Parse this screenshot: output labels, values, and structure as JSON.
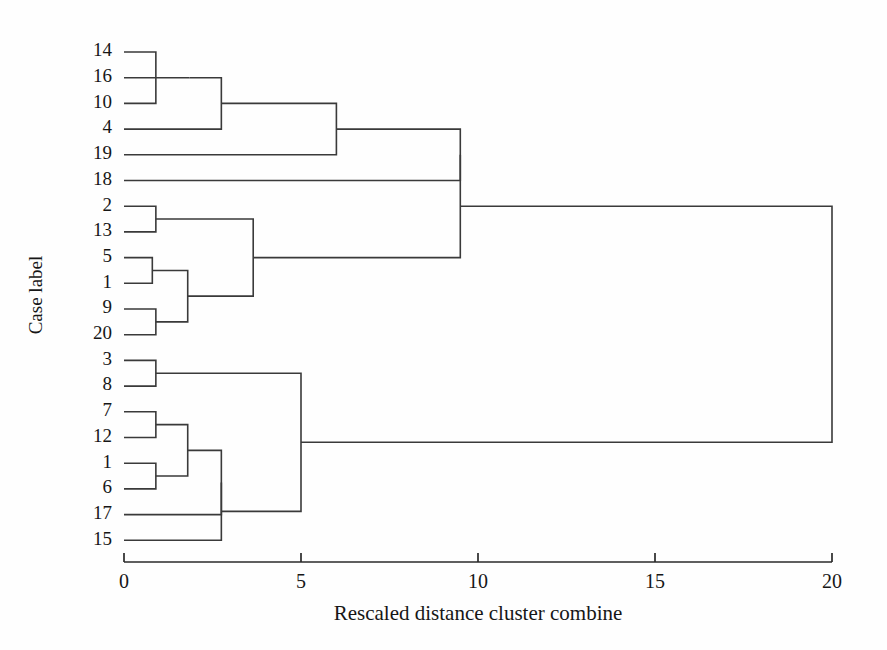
{
  "figure": {
    "title": "",
    "background": "#fefefe",
    "line_color": "#3a3a3a",
    "text_color": "#161616"
  },
  "chart_data": {
    "type": "dendrogram",
    "title": "",
    "xlabel": "Rescaled distance cluster combine",
    "ylabel": "Case label",
    "xlim": [
      0,
      20
    ],
    "xticks": [
      0,
      5,
      10,
      15,
      20
    ],
    "xticklabels": [
      "0",
      "5",
      "10",
      "15",
      "20"
    ],
    "grid": false,
    "orientation": "horizontal",
    "leaf_labels": [
      "14",
      "16",
      "10",
      "4",
      "19",
      "18",
      "2",
      "13",
      "5",
      "1",
      "9",
      "20",
      "3",
      "8",
      "7",
      "12",
      "1",
      "6",
      "17",
      "15"
    ],
    "leaf_order_index": [
      0,
      1,
      2,
      3,
      4,
      5,
      6,
      7,
      8,
      9,
      10,
      11,
      12,
      13,
      14,
      15,
      16,
      17,
      18,
      19
    ],
    "merges": [
      {
        "id": "m1",
        "left": {
          "type": "leaf",
          "index": 0
        },
        "right": {
          "type": "leaf",
          "index": 2
        },
        "distance": 0.9
      },
      {
        "id": "m2",
        "left": {
          "type": "node",
          "id": "m1"
        },
        "right": {
          "type": "leaf",
          "index": 1
        },
        "distance": 1.85
      },
      {
        "id": "m3",
        "left": {
          "type": "node",
          "id": "m2"
        },
        "right": {
          "type": "leaf",
          "index": 3
        },
        "distance": 2.75
      },
      {
        "id": "m4",
        "left": {
          "type": "node",
          "id": "m3"
        },
        "right": {
          "type": "leaf",
          "index": 4
        },
        "distance": 6.0
      },
      {
        "id": "m5",
        "left": {
          "type": "node",
          "id": "m4"
        },
        "right": {
          "type": "leaf",
          "index": 5
        },
        "distance": 9.5
      },
      {
        "id": "m6",
        "left": {
          "type": "leaf",
          "index": 6
        },
        "right": {
          "type": "leaf",
          "index": 7
        },
        "distance": 0.9
      },
      {
        "id": "m7",
        "left": {
          "type": "leaf",
          "index": 8
        },
        "right": {
          "type": "leaf",
          "index": 9
        },
        "distance": 0.8
      },
      {
        "id": "m8",
        "left": {
          "type": "leaf",
          "index": 10
        },
        "right": {
          "type": "leaf",
          "index": 11
        },
        "distance": 0.9
      },
      {
        "id": "m9",
        "left": {
          "type": "node",
          "id": "m7"
        },
        "right": {
          "type": "node",
          "id": "m8"
        },
        "distance": 1.8
      },
      {
        "id": "m10",
        "left": {
          "type": "node",
          "id": "m6"
        },
        "right": {
          "type": "node",
          "id": "m9"
        },
        "distance": 3.65
      },
      {
        "id": "m11",
        "left": {
          "type": "node",
          "id": "m5"
        },
        "right": {
          "type": "node",
          "id": "m10"
        },
        "distance": 9.5
      },
      {
        "id": "m12",
        "left": {
          "type": "leaf",
          "index": 12
        },
        "right": {
          "type": "leaf",
          "index": 13
        },
        "distance": 0.9
      },
      {
        "id": "m13",
        "left": {
          "type": "leaf",
          "index": 14
        },
        "right": {
          "type": "leaf",
          "index": 15
        },
        "distance": 0.9
      },
      {
        "id": "m14",
        "left": {
          "type": "leaf",
          "index": 16
        },
        "right": {
          "type": "leaf",
          "index": 17
        },
        "distance": 0.9
      },
      {
        "id": "m15",
        "left": {
          "type": "node",
          "id": "m13"
        },
        "right": {
          "type": "node",
          "id": "m14"
        },
        "distance": 1.8
      },
      {
        "id": "m16",
        "left": {
          "type": "node",
          "id": "m15"
        },
        "right": {
          "type": "leaf",
          "index": 18
        },
        "distance": 2.75
      },
      {
        "id": "m17",
        "left": {
          "type": "node",
          "id": "m16"
        },
        "right": {
          "type": "leaf",
          "index": 19
        },
        "distance": 2.75
      },
      {
        "id": "m18",
        "left": {
          "type": "node",
          "id": "m12"
        },
        "right": {
          "type": "node",
          "id": "m17"
        },
        "distance": 5.0
      },
      {
        "id": "m19",
        "left": {
          "type": "node",
          "id": "m11"
        },
        "right": {
          "type": "node",
          "id": "m18"
        },
        "distance": 20.0
      }
    ]
  },
  "geometry": {
    "plot_left_px": 124,
    "plot_right_px": 832,
    "leaf_top_px": 52,
    "leaf_step_px": 25.7,
    "axis_y_px": 562,
    "tick_len_px": 9,
    "label_offset_px": 12,
    "xlabel_y_px": 620,
    "ylabel_x_px": 42,
    "ylabel_y_px": 295
  }
}
